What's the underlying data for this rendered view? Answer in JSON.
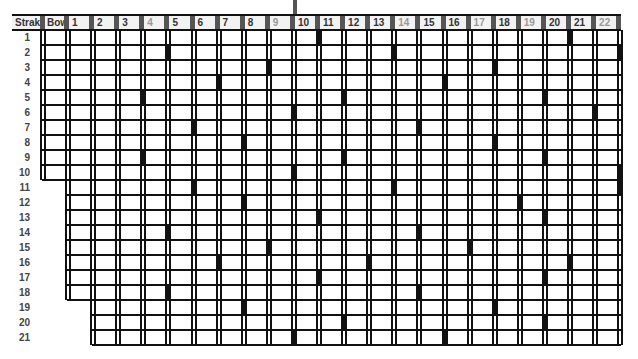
{
  "header": {
    "strake_label": "Strake",
    "bow_label": "Bow",
    "columns": [
      "1",
      "2",
      "3",
      "4",
      "5",
      "6",
      "7",
      "8",
      "9",
      "10",
      "11",
      "12",
      "13",
      "14",
      "15",
      "16",
      "17",
      "18",
      "19",
      "20",
      "21",
      "22"
    ],
    "dim_columns": [
      "4",
      "9",
      "14",
      "17",
      "19",
      "22"
    ]
  },
  "rows": [
    "1",
    "2",
    "3",
    "4",
    "5",
    "6",
    "7",
    "8",
    "9",
    "10",
    "11",
    "12",
    "13",
    "14",
    "15",
    "16",
    "17",
    "18",
    "19",
    "20",
    "21"
  ],
  "row_start_column": {
    "note": "first grid column present per row (0 = Bow)",
    "values": [
      0,
      0,
      0,
      0,
      0,
      0,
      0,
      0,
      0,
      0,
      1,
      1,
      1,
      1,
      1,
      1,
      1,
      1,
      2,
      2,
      2
    ]
  },
  "markers": [
    [
      11,
      21
    ],
    [
      5,
      14,
      23
    ],
    [
      9,
      18
    ],
    [
      7,
      16
    ],
    [
      4,
      12,
      20
    ],
    [
      10,
      22
    ],
    [
      6,
      15
    ],
    [
      8,
      18
    ],
    [
      4,
      12,
      20
    ],
    [
      10,
      23
    ],
    [
      6,
      14,
      23
    ],
    [
      8,
      19
    ],
    [
      11,
      20
    ],
    [
      5,
      15
    ],
    [
      9,
      17
    ],
    [
      7,
      13,
      21
    ],
    [
      11,
      20
    ],
    [
      5,
      15
    ],
    [
      8,
      18
    ],
    [
      12,
      20
    ],
    [
      10,
      16
    ]
  ],
  "colors": {
    "line": "#111111",
    "header_bg": "#f2f2f2",
    "header_sep": "#555555",
    "marker": "#111111"
  }
}
